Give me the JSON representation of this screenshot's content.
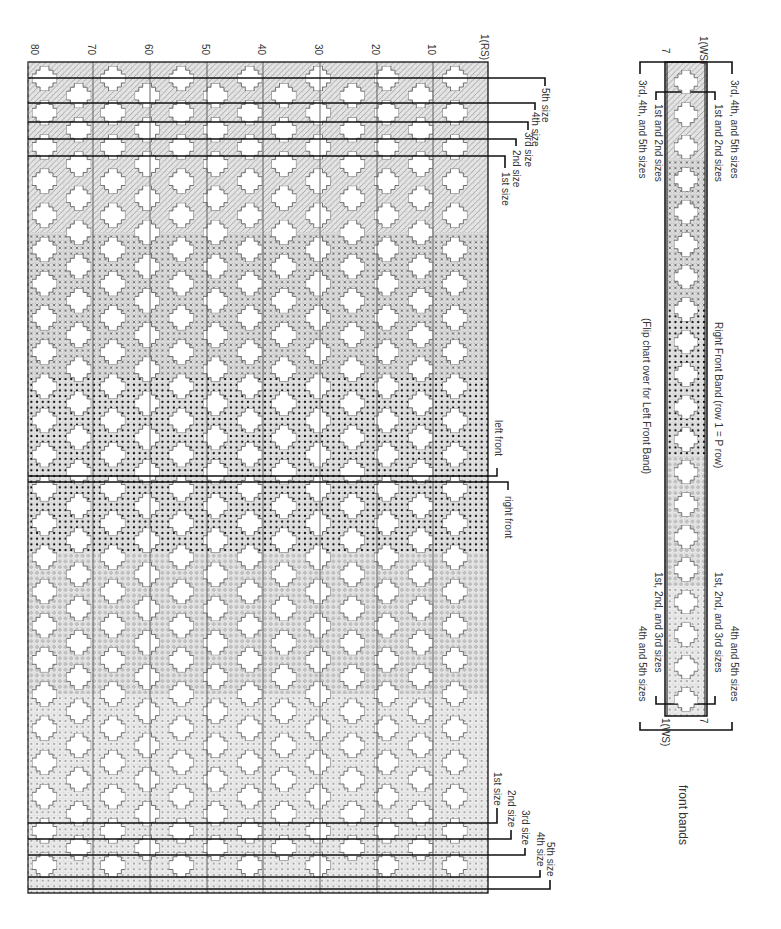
{
  "main_chart": {
    "row_labels": [
      {
        "label": "80",
        "x": 36
      },
      {
        "label": "70",
        "x": 93
      },
      {
        "label": "60",
        "x": 150
      },
      {
        "label": "50",
        "x": 207
      },
      {
        "label": "40",
        "x": 263
      },
      {
        "label": "30",
        "x": 320
      },
      {
        "label": "20",
        "x": 377
      },
      {
        "label": "10",
        "x": 433
      },
      {
        "label": "1(RS)",
        "x": 486
      }
    ],
    "top_size_labels": [
      "1st size",
      "2nd size",
      "3rd size",
      "4th size",
      "5th size"
    ],
    "bottom_size_labels": [
      "1st size",
      "2nd size",
      "3rd size",
      "4th size",
      "5th size"
    ],
    "divider_labels": {
      "left": "left front",
      "right": "right front"
    },
    "pattern_zones": [
      {
        "name": "hatched",
        "from_y": 62,
        "to_y": 232
      },
      {
        "name": "cross",
        "from_y": 232,
        "to_y": 378
      },
      {
        "name": "bold-dot",
        "from_y": 378,
        "to_y": 552
      },
      {
        "name": "circle",
        "from_y": 552,
        "to_y": 694
      },
      {
        "name": "small-dot",
        "from_y": 694,
        "to_y": 893
      }
    ]
  },
  "band_chart": {
    "top_row_labels": {
      "left": "7",
      "right": "1(WS)"
    },
    "bottom_row_labels": {
      "left": "1(WS)",
      "right": "7"
    },
    "top_left_labels": [
      "3rd, 4th, and 5th sizes",
      "1st and 2nd sizes"
    ],
    "top_right_labels": [
      "1st and 2nd sizes",
      "3rd, 4th, and 5th sizes"
    ],
    "bottom_left_labels": [
      "1st, 2nd, and 3rd sizes",
      "4th and 5th sizes"
    ],
    "bottom_right_labels": [
      "1st, 2nd, and 3rd sizes",
      "4th and 5th sizes"
    ],
    "flip_note": "(Flip chart over for Left Front Band)",
    "title": "Right Front Band (row 1 = P row)",
    "caption": "front bands"
  }
}
